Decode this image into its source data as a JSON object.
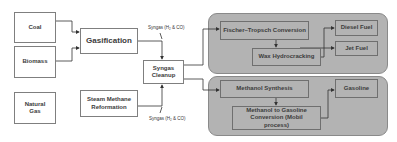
{
  "diagram": {
    "feedstocks": [
      {
        "id": "coal",
        "label": "Coal"
      },
      {
        "id": "biomass",
        "label": "Biomass"
      },
      {
        "id": "natural_gas",
        "label": "Natural Gas"
      }
    ],
    "processes": {
      "gasification": "Gasification",
      "steam_methane_reformation": "Steam Methane Reformation",
      "syngas_cleanup": "Syngas Cleanup"
    },
    "syngas_labels": {
      "top": "Syngas (H₂ & CO)",
      "bottom": "Syngas (H₂ & CO)"
    },
    "panels": {
      "fischer_tropsch": {
        "conversion": "Fischer–Tropsch Conversion",
        "wax_hydrocracking": "Wax Hydrocracking",
        "products": [
          "Diesel Fuel",
          "Jet Fuel"
        ]
      },
      "methanol": {
        "synthesis": "Methanol Synthesis",
        "mtg": "Methanol to Gasoline Conversion (Mobil process)",
        "products": [
          "Gasoline"
        ]
      }
    },
    "colors": {
      "panel_fill": "#b3b3b3",
      "box_border": "#7f7f7f",
      "arrow": "#333333"
    }
  }
}
